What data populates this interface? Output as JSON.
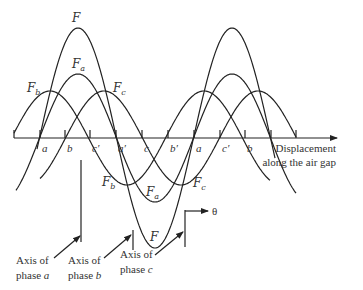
{
  "axis": {
    "label_line1": "Displacement",
    "label_line2": "along the air gap",
    "theta_label": "θ"
  },
  "tick_labels": [
    {
      "text": "a",
      "x": 40
    },
    {
      "text": "b",
      "x": 65
    },
    {
      "text": "c′",
      "x": 90
    },
    {
      "text": "a′",
      "x": 116
    },
    {
      "text": "c",
      "x": 142
    },
    {
      "text": "b′",
      "x": 168
    },
    {
      "text": "a",
      "x": 194
    },
    {
      "text": "c′",
      "x": 220
    },
    {
      "text": "b",
      "x": 245
    }
  ],
  "waves": {
    "F": {
      "label": "F",
      "sub": "",
      "amplitude": 110,
      "peak_x": 78
    },
    "Fa": {
      "label": "F",
      "sub": "a",
      "amplitude": 64,
      "peak_x": 78
    },
    "Fb": {
      "label": "F",
      "sub": "b",
      "amplitude": 47,
      "peak_x": 50
    },
    "Fc": {
      "label": "F",
      "sub": "c",
      "amplitude": 47,
      "peak_x": 104
    }
  },
  "phase_axes": [
    {
      "line1": "Axis of",
      "line2": "phase ",
      "phase": "a"
    },
    {
      "line1": "Axis of",
      "line2": "phase ",
      "phase": "b"
    },
    {
      "line1": "Axis of",
      "line2": "phase ",
      "phase": "c"
    }
  ],
  "chart_data": {
    "type": "line",
    "title": "",
    "xlabel": "Displacement along the air gap",
    "ylabel": "",
    "period_px": 154,
    "series": [
      {
        "name": "F (resultant)",
        "amplitude": 1.5,
        "phase_deg": 0
      },
      {
        "name": "Fa",
        "amplitude": 1.0,
        "phase_deg": 0
      },
      {
        "name": "Fb",
        "amplitude": 0.73,
        "phase_deg": -67
      },
      {
        "name": "Fc",
        "amplitude": 0.73,
        "phase_deg": 67
      }
    ],
    "x_tick_labels": [
      "a",
      "b",
      "c′",
      "a′",
      "c",
      "b′",
      "a",
      "c′",
      "b"
    ]
  }
}
